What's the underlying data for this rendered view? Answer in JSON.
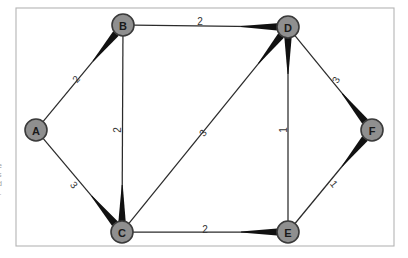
{
  "figure": {
    "background_color": "#ffffff",
    "frame": {
      "x": 16,
      "y": 8,
      "width": 378,
      "height": 238,
      "stroke_color": "#b4b4b4"
    },
    "caption_fragment": ":\ne\ns\nd\nl."
  },
  "style": {
    "node_fill": "#8f8f8f",
    "node_stroke": "#3a3a3a",
    "node_radius": 11,
    "edge_color": "#2b2b2b",
    "edge_head_color": "#111111",
    "label_color": "#1a1a1a",
    "weight_color": "#333333"
  },
  "chart_data": {
    "type": "diagram",
    "subtype": "weighted-graph",
    "directed": false,
    "node_count": 6,
    "edge_count": 9,
    "nodes": [
      {
        "id": "A",
        "label": "A",
        "x": 36,
        "y": 130
      },
      {
        "id": "B",
        "label": "B",
        "x": 123,
        "y": 25
      },
      {
        "id": "C",
        "label": "C",
        "x": 122,
        "y": 232
      },
      {
        "id": "D",
        "label": "D",
        "x": 288,
        "y": 27
      },
      {
        "id": "E",
        "label": "E",
        "x": 288,
        "y": 232
      },
      {
        "id": "F",
        "label": "F",
        "x": 372,
        "y": 130
      }
    ],
    "edges": [
      {
        "id": "A-B",
        "source": "A",
        "target": "B",
        "weight": "2",
        "head_at": "B",
        "label_x": 76,
        "label_y": 79,
        "label_rotate": -50
      },
      {
        "id": "A-C",
        "source": "A",
        "target": "C",
        "weight": "3",
        "head_at": "C",
        "label_x": 74,
        "label_y": 185,
        "label_rotate": 50
      },
      {
        "id": "B-D",
        "source": "B",
        "target": "D",
        "weight": "2",
        "head_at": "D",
        "label_x": 200,
        "label_y": 21,
        "label_rotate": 0
      },
      {
        "id": "B-C",
        "source": "B",
        "target": "C",
        "weight": "2",
        "head_at": "C",
        "label_x": 117,
        "label_y": 130,
        "label_rotate": -90
      },
      {
        "id": "C-D",
        "source": "C",
        "target": "D",
        "weight": "3",
        "head_at": "D",
        "label_x": 203,
        "label_y": 133,
        "label_rotate": -52
      },
      {
        "id": "C-E",
        "source": "C",
        "target": "E",
        "weight": "2",
        "head_at": "E",
        "label_x": 205,
        "label_y": 229,
        "label_rotate": 0
      },
      {
        "id": "D-E",
        "source": "D",
        "target": "E",
        "weight": "1",
        "head_at": "D",
        "label_x": 283,
        "label_y": 130,
        "label_rotate": -90
      },
      {
        "id": "D-F",
        "source": "D",
        "target": "F",
        "weight": "3",
        "head_at": "F",
        "label_x": 336,
        "label_y": 80,
        "label_rotate": -62
      },
      {
        "id": "E-F",
        "source": "E",
        "target": "F",
        "weight": "1",
        "head_at": "F",
        "label_x": 334,
        "label_y": 184,
        "label_rotate": 50
      }
    ]
  }
}
